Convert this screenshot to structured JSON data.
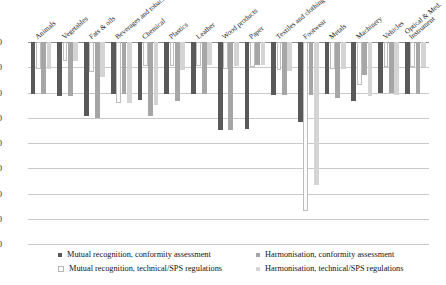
{
  "chart_data": {
    "type": "bar",
    "title": "",
    "subtitle": "",
    "xlabel": "",
    "ylabel": "",
    "ylim": [
      -80,
      0
    ],
    "yticks": [
      0,
      -10,
      -20,
      -30,
      -40,
      -50,
      -60,
      -70,
      -80
    ],
    "ytick_labels": [
      "0",
      "-10",
      "-20",
      "-30",
      "-40",
      "-50",
      "-60",
      "-70",
      "-80"
    ],
    "grid": true,
    "legend_position": "bottom",
    "orientation": "vertical",
    "categories": [
      "Animals",
      "Vegetables",
      "Fats & oils",
      "Beverages and tobacco",
      "Chemical",
      "Plastics",
      "Leather",
      "Wood products",
      "Paper",
      "Textiles and clothing",
      "Footwear",
      "Metals",
      "Machinery",
      "Vehicles",
      "Optical & Med. Instrument"
    ],
    "series": [
      {
        "name": "Mutual recognition, conformity assessment",
        "color": "#595959",
        "values": [
          -20.5,
          -21.5,
          -29.5,
          -20.5,
          -23.0,
          -20.5,
          -20.5,
          -35.0,
          -34.5,
          -21.0,
          -31.5,
          -20.5,
          -23.5,
          -20.0,
          -20.5
        ]
      },
      {
        "name": "Mutual recognition, technical/SPS regulations",
        "color": "#fbfbfb",
        "values": [
          -10.5,
          -7.5,
          -12.0,
          -24.0,
          -9.5,
          -9.5,
          -9.5,
          -10.5,
          -10.0,
          -11.0,
          -67.0,
          -10.5,
          -17.0,
          -10.0,
          -10.0
        ]
      },
      {
        "name": "Harmonisation, conformity assessment",
        "color": "#a6a6a6",
        "values": [
          -20.5,
          -21.5,
          -30.0,
          -20.5,
          -29.5,
          -23.5,
          -20.5,
          -35.0,
          -9.0,
          -21.0,
          -21.0,
          -22.0,
          -13.0,
          -20.0,
          -20.5
        ]
      },
      {
        "name": "Harmonisation, technical/SPS regulations",
        "color": "#d4d4d4",
        "values": [
          -10.5,
          -7.5,
          -14.0,
          -24.0,
          -25.0,
          -11.0,
          -9.0,
          -9.5,
          -9.0,
          -11.5,
          -56.5,
          -10.5,
          -21.5,
          -21.0,
          -10.0
        ]
      }
    ]
  },
  "legend": {
    "entries": [
      "Mutual recognition, conformity assessment",
      "Harmonisation, conformity assessment",
      "Mutual recognition, technical/SPS regulations",
      "Harmonisation, technical/SPS regulations"
    ]
  }
}
